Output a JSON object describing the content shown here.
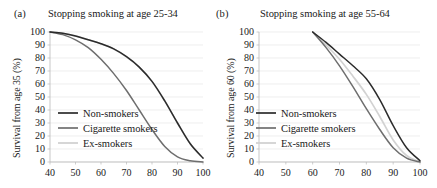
{
  "figure": {
    "background": "#ffffff",
    "text_color": "#1a1a1a",
    "gridline_color": "#e3e3e3",
    "axis_color": "#b9b9b9"
  },
  "series_colors": {
    "non_smokers": "#2b2b2b",
    "cigarette_smokers": "#6e6e6e",
    "ex_smokers": "#d2d2d2"
  },
  "panel_a": {
    "letter": "(a)",
    "title": "Stopping smoking at age 25-34",
    "ylabel": "Survival from age 35 (%)",
    "xlabel": "",
    "legend": [
      {
        "label": "Non-smokers",
        "color": "#2b2b2b"
      },
      {
        "label": "Cigarette smokers",
        "color": "#6e6e6e"
      },
      {
        "label": "Ex-smokers",
        "color": "#d2d2d2"
      }
    ],
    "yticks": [
      "0",
      "10",
      "20",
      "30",
      "40",
      "50",
      "60",
      "70",
      "80",
      "90",
      "100"
    ],
    "xticks": [
      "40",
      "50",
      "60",
      "70",
      "80",
      "90",
      "100"
    ]
  },
  "panel_b": {
    "letter": "(b)",
    "title": "Stopping smoking at age 55-64",
    "ylabel": "Survival from age 60 (%)",
    "xlabel": "",
    "legend": [
      {
        "label": "Non-smokers",
        "color": "#2b2b2b"
      },
      {
        "label": "Cigarette smokers",
        "color": "#6e6e6e"
      },
      {
        "label": "Ex-smokers",
        "color": "#d2d2d2"
      }
    ],
    "yticks": [
      "0",
      "10",
      "20",
      "30",
      "40",
      "50",
      "60",
      "70",
      "80",
      "90",
      "100"
    ],
    "xticks": [
      "40",
      "50",
      "60",
      "70",
      "80",
      "90",
      "100"
    ]
  },
  "chart_data": [
    {
      "type": "line",
      "panel": "(a)",
      "title": "Stopping smoking at age 25-34",
      "xlabel": "Age (years)",
      "ylabel": "Survival from age 35 (%)",
      "xlim": [
        40,
        100
      ],
      "ylim": [
        0,
        100
      ],
      "grid": true,
      "legend_position": "inside-left",
      "x": [
        40,
        45,
        50,
        55,
        60,
        65,
        70,
        75,
        80,
        85,
        90,
        95,
        100
      ],
      "series": [
        {
          "name": "Non-smokers",
          "color": "#2b2b2b",
          "values": [
            100,
            99,
            97,
            94,
            91,
            87,
            81,
            73,
            62,
            47,
            30,
            14,
            3
          ]
        },
        {
          "name": "Cigarette smokers",
          "color": "#6e6e6e",
          "values": [
            100,
            98,
            94,
            88,
            79,
            68,
            55,
            40,
            25,
            12,
            4,
            1,
            0
          ]
        },
        {
          "name": "Ex-smokers",
          "color": "#d2d2d2",
          "values": [
            100,
            99,
            97,
            94,
            91,
            87,
            81,
            73,
            62,
            47,
            30,
            14,
            3
          ]
        }
      ]
    },
    {
      "type": "line",
      "panel": "(b)",
      "title": "Stopping smoking at age 55-64",
      "xlabel": "Age (years)",
      "ylabel": "Survival from age 60 (%)",
      "xlim": [
        40,
        100
      ],
      "ylim": [
        0,
        100
      ],
      "grid": true,
      "legend_position": "inside-left",
      "x": [
        60,
        65,
        70,
        75,
        80,
        85,
        90,
        95,
        100
      ],
      "series": [
        {
          "name": "Non-smokers",
          "color": "#2b2b2b",
          "values": [
            100,
            92,
            83,
            74,
            64,
            48,
            28,
            11,
            1
          ]
        },
        {
          "name": "Cigarette smokers",
          "color": "#6e6e6e",
          "values": [
            100,
            88,
            74,
            58,
            41,
            25,
            11,
            3,
            0
          ]
        },
        {
          "name": "Ex-smokers",
          "color": "#d2d2d2",
          "values": [
            100,
            90,
            79,
            66,
            52,
            35,
            17,
            5,
            0
          ]
        }
      ]
    }
  ]
}
